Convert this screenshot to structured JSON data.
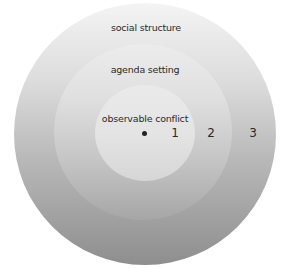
{
  "diagram": {
    "type": "concentric-circles",
    "rings": [
      {
        "level": 3,
        "label": "social structure",
        "number": "3"
      },
      {
        "level": 2,
        "label": "agenda setting",
        "number": "2"
      },
      {
        "level": 1,
        "label": "observable conflict",
        "number": "1"
      }
    ],
    "center_marker": "dot",
    "colors": {
      "outer_top": "#f4f4f4",
      "outer_bottom": "#8e8e8e",
      "middle_top": "#ececec",
      "middle_bottom": "#a6a6a6",
      "inner_top": "#eaeaea",
      "inner_bottom": "#d6d6d6",
      "text": "#2a2a2a",
      "dot": "#222222"
    }
  }
}
